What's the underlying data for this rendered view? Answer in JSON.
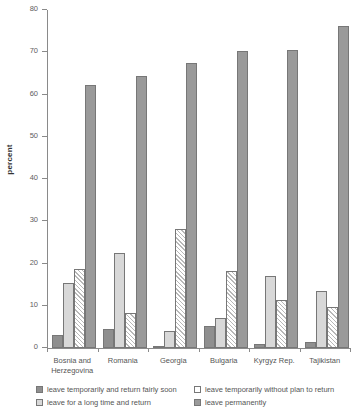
{
  "chart_data": {
    "type": "bar",
    "title": "",
    "subtitle": "",
    "xlabel": "",
    "ylabel": "percent",
    "ylim": [
      0,
      80
    ],
    "yticks": [
      0,
      10,
      20,
      30,
      40,
      50,
      60,
      70,
      80
    ],
    "grid": false,
    "legend_position": "bottom",
    "categories": [
      "Bosnia and Herzegovina",
      "Romania",
      "Georgia",
      "Bulgaria",
      "Kyrgyz Rep.",
      "Tajikistan"
    ],
    "series": [
      {
        "name": "leave temporarily and return fairly soon",
        "swatch": "sw-dark",
        "values": [
          3.0,
          4.5,
          0.3,
          5.2,
          1.0,
          1.5
        ]
      },
      {
        "name": "leave for a long time and return",
        "swatch": "sw-light",
        "values": [
          15.4,
          22.5,
          4.0,
          7.0,
          17.0,
          13.5
        ]
      },
      {
        "name": "leave temporarily without plan to return",
        "swatch": "sw-hatch",
        "values": [
          18.7,
          8.4,
          28.2,
          18.2,
          11.4,
          9.8
        ]
      },
      {
        "name": "leave permanently",
        "swatch": "sw-dark2",
        "values": [
          62.3,
          64.5,
          67.4,
          70.4,
          70.6,
          76.2
        ]
      }
    ]
  },
  "axis": {
    "y_title": "percent",
    "tick_labels": [
      "0",
      "10",
      "20",
      "30",
      "40",
      "50",
      "60",
      "70",
      "80"
    ]
  },
  "category_labels": [
    "Bosnia and\nHerzegovina",
    "Romania",
    "Georgia",
    "Bulgaria",
    "Kyrgyz Rep.",
    "Tajikistan"
  ],
  "legend": {
    "items": [
      {
        "label": "leave temporarily and return fairly soon",
        "swatch": "sw-dark"
      },
      {
        "label": "leave temporarily without plan to return",
        "swatch": "sw-hatch"
      },
      {
        "label": "leave for a long time and return",
        "swatch": "sw-light"
      },
      {
        "label": "leave permanently",
        "swatch": "sw-dark2"
      }
    ]
  }
}
